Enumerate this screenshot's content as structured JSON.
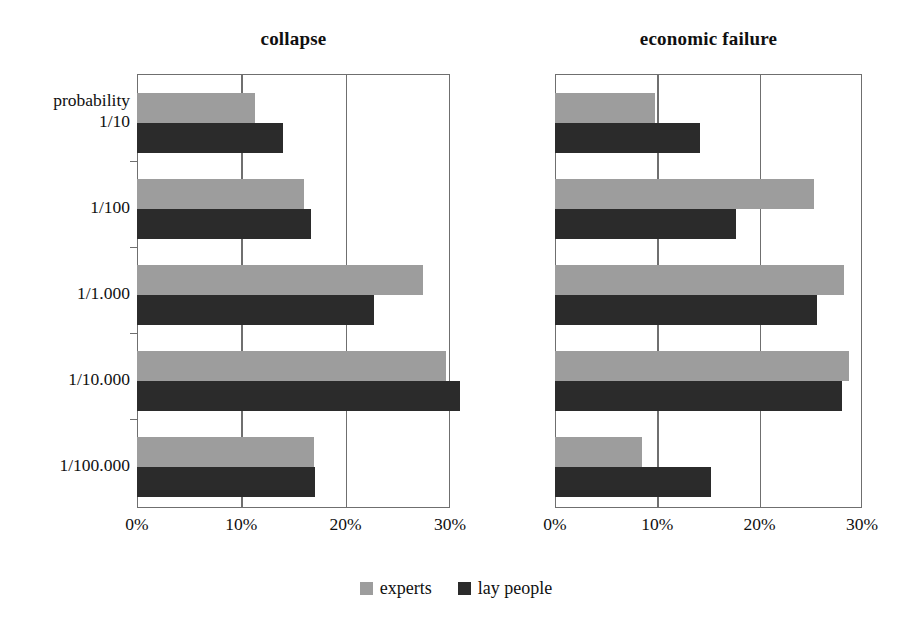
{
  "chart_data": {
    "type": "bar",
    "orientation": "horizontal",
    "title": "",
    "panels": [
      {
        "title": "collapse",
        "categories": [
          "probability 1/10",
          "1/100",
          "1/1.000",
          "1/10.000",
          "1/100.000"
        ],
        "series": [
          {
            "name": "experts",
            "values": [
              11.3,
              16.0,
              27.4,
              29.6,
              17.0
            ]
          },
          {
            "name": "lay people",
            "values": [
              14.0,
              16.7,
              22.7,
              31.0,
              17.1
            ]
          }
        ],
        "xlabel": "",
        "ylabel": "",
        "xlim": [
          0,
          30
        ],
        "xticks": [
          "0%",
          "10%",
          "20%",
          "30%"
        ]
      },
      {
        "title": "economic failure",
        "categories": [
          "probability 1/10",
          "1/100",
          "1/1.000",
          "1/10.000",
          "1/100.000"
        ],
        "series": [
          {
            "name": "experts",
            "values": [
              9.8,
              25.3,
              28.2,
              28.7,
              8.5
            ]
          },
          {
            "name": "lay people",
            "values": [
              14.2,
              17.7,
              25.6,
              28.0,
              15.2
            ]
          }
        ],
        "xlabel": "",
        "ylabel": "",
        "xlim": [
          0,
          30
        ],
        "xticks": [
          "0%",
          "10%",
          "20%",
          "30%"
        ]
      }
    ],
    "legend": [
      {
        "name": "experts",
        "color": "#9d9d9d"
      },
      {
        "name": "lay people",
        "color": "#2b2b2b"
      }
    ],
    "legend_position": "bottom-center",
    "grid": true,
    "xtick_values": [
      0,
      10,
      20,
      30
    ]
  },
  "panel_titles": {
    "left": "collapse",
    "right": "economic failure"
  },
  "category_labels": [
    {
      "line1": "probability",
      "line2": "1/10"
    },
    {
      "line1": "",
      "line2": "1/100"
    },
    {
      "line1": "",
      "line2": "1/1.000"
    },
    {
      "line1": "",
      "line2": "1/10.000"
    },
    {
      "line1": "",
      "line2": "1/100.000"
    }
  ],
  "xticks": {
    "left": [
      "0%",
      "10%",
      "20%",
      "30%"
    ],
    "right": [
      "0%",
      "10%",
      "20%",
      "30%"
    ]
  },
  "legend": {
    "experts_label": "experts",
    "lay_label": "lay people"
  },
  "colors": {
    "experts": "#9d9d9d",
    "lay": "#2b2b2b",
    "axis": "#6f6f6f",
    "text": "#101010",
    "background": "#ffffff"
  }
}
